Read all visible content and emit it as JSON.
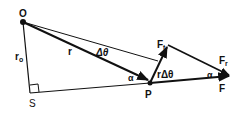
{
  "diagram": {
    "labels": {
      "O": "O",
      "S": "S",
      "P": "P",
      "r": "r",
      "r0_main": "r",
      "r0_sub": "o",
      "delta_theta": "Δθ",
      "alpha_left": "α",
      "alpha_right": "α",
      "r_delta_theta": "rΔθ",
      "Ft_main": "F",
      "Ft_sub": "t",
      "Fr_main": "F",
      "Fr_sub": "r",
      "F": "F"
    },
    "colors": {
      "stroke": "#111111",
      "background": "#ffffff"
    }
  }
}
